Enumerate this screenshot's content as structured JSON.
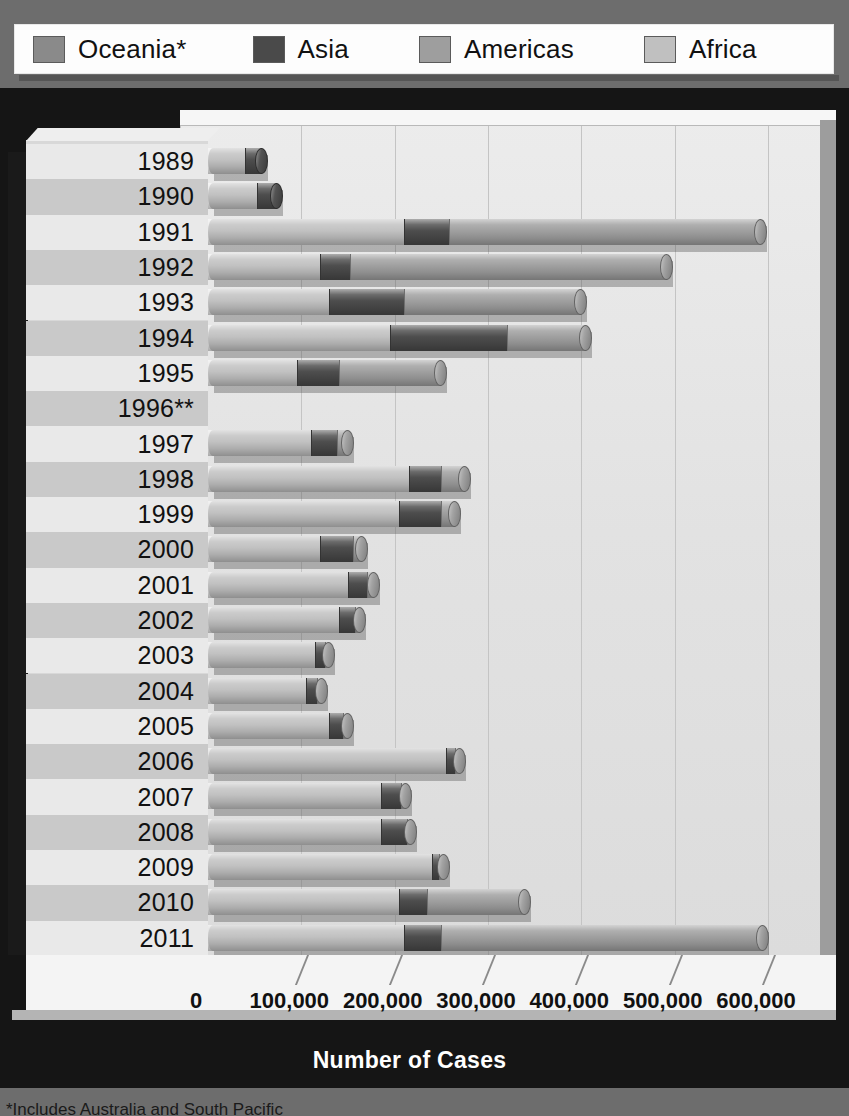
{
  "legend": {
    "items": [
      {
        "label": "Oceania*",
        "color": "#8a8a8a",
        "key": "oceania"
      },
      {
        "label": "Asia",
        "color": "#4a4a4a",
        "key": "asia"
      },
      {
        "label": "Americas",
        "color": "#9e9e9e",
        "key": "americas"
      },
      {
        "label": "Africa",
        "color": "#c0c0c0",
        "key": "africa"
      }
    ]
  },
  "axes": {
    "y_title": "Year",
    "x_title": "Number of Cases",
    "x_ticks": [
      "0",
      "100,000",
      "200,000",
      "300,000",
      "400,000",
      "500,000",
      "600,000"
    ],
    "x_tick_values": [
      0,
      100000,
      200000,
      300000,
      400000,
      500000,
      600000
    ]
  },
  "footnote": "*Includes Australia and South Pacific",
  "chart_data": {
    "type": "bar",
    "orientation": "horizontal",
    "stacked": true,
    "title": "",
    "xlabel": "Number of Cases",
    "ylabel": "Year",
    "xlim": [
      0,
      620000
    ],
    "grid": true,
    "legend_position": "top",
    "categories": [
      "1989",
      "1990",
      "1991",
      "1992",
      "1993",
      "1994",
      "1995",
      "1996**",
      "1997",
      "1998",
      "1999",
      "2000",
      "2001",
      "2002",
      "2003",
      "2004",
      "2005",
      "2006",
      "2007",
      "2008",
      "2009",
      "2010",
      "2011"
    ],
    "series": [
      {
        "name": "Africa",
        "color": "#c0c0c0",
        "values": [
          40000,
          52000,
          210000,
          120000,
          130000,
          195000,
          95000,
          0,
          110000,
          215000,
          205000,
          120000,
          150000,
          140000,
          115000,
          105000,
          130000,
          255000,
          185000,
          185000,
          240000,
          205000,
          210000
        ]
      },
      {
        "name": "Asia",
        "color": "#4a4a4a",
        "values": [
          18000,
          22000,
          48000,
          32000,
          80000,
          125000,
          45000,
          0,
          28000,
          35000,
          45000,
          35000,
          20000,
          18000,
          10000,
          12000,
          15000,
          10000,
          22000,
          28000,
          8000,
          30000,
          40000
        ]
      },
      {
        "name": "Americas",
        "color": "#9e9e9e",
        "values": [
          0,
          0,
          335000,
          340000,
          190000,
          85000,
          110000,
          0,
          12000,
          25000,
          15000,
          10000,
          8000,
          5000,
          5000,
          5000,
          5000,
          5000,
          5000,
          5000,
          5000,
          105000,
          345000
        ]
      },
      {
        "name": "Oceania*",
        "color": "#8a8a8a",
        "values": [
          0,
          0,
          0,
          0,
          0,
          0,
          0,
          0,
          0,
          0,
          0,
          0,
          0,
          0,
          0,
          0,
          0,
          0,
          0,
          0,
          0,
          0,
          0
        ]
      }
    ],
    "totals": [
      58000,
      74000,
      593000,
      492000,
      400000,
      405000,
      250000,
      0,
      150000,
      275000,
      265000,
      165000,
      178000,
      163000,
      130000,
      122000,
      150000,
      270000,
      212000,
      218000,
      253000,
      340000,
      595000
    ],
    "note_1996": "No data reported for 1996"
  }
}
